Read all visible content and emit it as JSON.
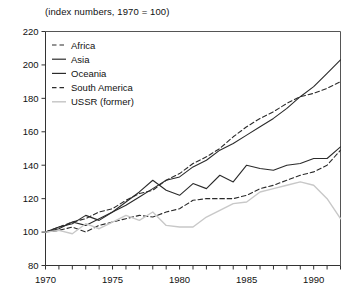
{
  "chart_data": {
    "type": "line",
    "title": "(index numbers, 1970 = 100)",
    "xlabel": "",
    "ylabel": "",
    "xlim": [
      1970,
      1992
    ],
    "ylim": [
      80,
      220
    ],
    "ytick_labels": [
      "220",
      "200",
      "180",
      "160",
      "140",
      "120",
      "100",
      "80"
    ],
    "yticks": [
      220,
      200,
      180,
      160,
      140,
      120,
      100,
      80
    ],
    "xtick_labels": [
      "1970",
      "1975",
      "1980",
      "1985",
      "1990"
    ],
    "xticks": [
      1970,
      1975,
      1980,
      1985,
      1990
    ],
    "minor_xticks_every": 1,
    "grid": false,
    "legend_position": "top-left",
    "x": [
      1970,
      1971,
      1972,
      1973,
      1974,
      1975,
      1976,
      1977,
      1978,
      1979,
      1980,
      1981,
      1982,
      1983,
      1984,
      1985,
      1986,
      1987,
      1988,
      1989,
      1990,
      1991,
      1992
    ],
    "series": [
      {
        "name": "Africa",
        "style": "dashed",
        "color": "#2b2b2b",
        "values": [
          100,
          101,
          103,
          100,
          104,
          106,
          108,
          110,
          109,
          112,
          114,
          119,
          120,
          120,
          120,
          122,
          126,
          128,
          131,
          134,
          136,
          140,
          149
        ]
      },
      {
        "name": "Asia",
        "style": "solid",
        "color": "#2b2b2b",
        "values": [
          100,
          103,
          105,
          110,
          107,
          112,
          116,
          121,
          126,
          131,
          133,
          139,
          143,
          149,
          153,
          158,
          163,
          168,
          174,
          181,
          187,
          195,
          203
        ]
      },
      {
        "name": "Oceania",
        "style": "solid",
        "color": "#2b2b2b",
        "values": [
          100,
          102,
          106,
          104,
          108,
          112,
          118,
          124,
          131,
          125,
          122,
          129,
          126,
          134,
          130,
          140,
          138,
          137,
          140,
          141,
          144,
          144,
          151
        ]
      },
      {
        "name": "South America",
        "style": "dashed",
        "color": "#2b2b2b",
        "values": [
          100,
          103,
          106,
          108,
          112,
          114,
          119,
          123,
          125,
          131,
          135,
          141,
          145,
          150,
          157,
          163,
          168,
          172,
          177,
          181,
          183,
          186,
          190
        ]
      },
      {
        "name": "USSR (former)",
        "style": "solid",
        "color": "#c8c8c8",
        "values": [
          100,
          101,
          99,
          105,
          102,
          106,
          110,
          107,
          112,
          104,
          103,
          103,
          109,
          113,
          117,
          118,
          124,
          126,
          128,
          130,
          128,
          120,
          108
        ]
      }
    ]
  },
  "legend": {
    "items": [
      {
        "label": "Africa"
      },
      {
        "label": "Asia"
      },
      {
        "label": "Oceania"
      },
      {
        "label": "South America"
      },
      {
        "label": "USSR (former)"
      }
    ]
  }
}
